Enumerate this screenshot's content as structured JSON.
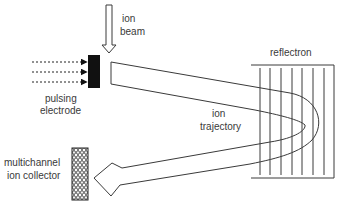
{
  "diagram": {
    "type": "reflectron time-of-flight mass spectrometer schematic",
    "labels": {
      "ion_beam_line1": "ion",
      "ion_beam_line2": "beam",
      "pulsing_electrode_line1": "pulsing",
      "pulsing_electrode_line2": "electrode",
      "reflectron": "reflectron",
      "ion_trajectory_line1": "ion",
      "ion_trajectory_line2": "trajectory",
      "collector_line1": "multichannel",
      "collector_line2": "ion collector"
    },
    "colors": {
      "stroke": "#3a3a3a",
      "fill_dark": "#111111",
      "background": "#ffffff"
    },
    "reflectron_grid_count": 7,
    "dashed_arrow_count": 3
  }
}
